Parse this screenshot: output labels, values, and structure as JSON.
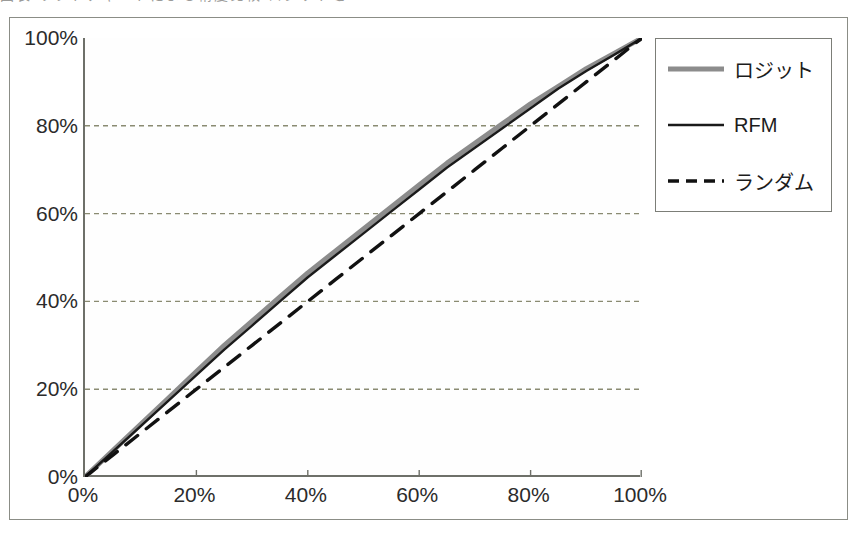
{
  "caption": {
    "text": "図表 リフトチャートによる精度比較 ロジットとRFM"
  },
  "chart_data": {
    "type": "line",
    "title": "",
    "subtitle": "",
    "xlabel": "",
    "ylabel": "",
    "xlim": [
      0,
      100
    ],
    "ylim": [
      0,
      100
    ],
    "grid": true,
    "grid_axis": "y",
    "grid_style": "dotted",
    "grid_color": "#8a8b72",
    "legend_position": "right",
    "x_tick_labels": [
      "0%",
      "20%",
      "40%",
      "60%",
      "80%",
      "100%"
    ],
    "x_ticks": [
      0,
      20,
      40,
      60,
      80,
      100
    ],
    "y_tick_labels": [
      "0%",
      "20%",
      "40%",
      "60%",
      "80%",
      "100%"
    ],
    "y_ticks": [
      0,
      20,
      40,
      60,
      80,
      100
    ],
    "x": [
      0,
      5,
      10,
      15,
      20,
      25,
      30,
      35,
      40,
      45,
      50,
      55,
      60,
      65,
      70,
      75,
      80,
      85,
      90,
      95,
      100
    ],
    "series": [
      {
        "name": "ロジット",
        "color": "#8c8c8c",
        "width": 5,
        "dash": "solid",
        "values": [
          0,
          6,
          12,
          18,
          24,
          30,
          35.5,
          41,
          46.5,
          51.5,
          56.5,
          61.5,
          66.5,
          71.5,
          76,
          80.5,
          85,
          89,
          93,
          96.5,
          100
        ]
      },
      {
        "name": "RFM",
        "color": "#1a1a1a",
        "width": 2.4,
        "dash": "solid",
        "values": [
          0,
          5.8,
          11.6,
          17.4,
          23.2,
          29,
          34.5,
          40,
          45.5,
          50.5,
          55.5,
          60.5,
          65.5,
          70.5,
          75,
          79.5,
          84,
          88.5,
          92.5,
          96.2,
          100
        ]
      },
      {
        "name": "ランダム",
        "color": "#111111",
        "width": 3.4,
        "dash": "dashed",
        "values": [
          0,
          5,
          10,
          15,
          20,
          25,
          30,
          35,
          40,
          45,
          50,
          55,
          60,
          65,
          70,
          75,
          80,
          85,
          90,
          95,
          100
        ]
      }
    ]
  },
  "legend": {
    "items": [
      {
        "label": "ロジット",
        "style": "thick-gray-solid"
      },
      {
        "label": "RFM",
        "style": "thin-black-solid"
      },
      {
        "label": "ランダム",
        "style": "black-dashed"
      }
    ]
  }
}
